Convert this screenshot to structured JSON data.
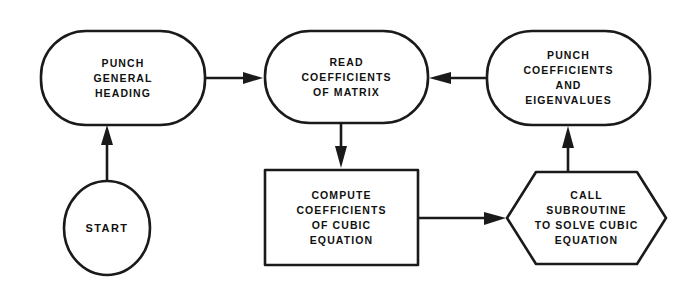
{
  "diagram": {
    "background_color": "#ffffff",
    "ink_color": "#1a1a1a",
    "width": 685,
    "height": 287
  },
  "nodes": {
    "start": {
      "shape": "ellipse",
      "lines": [
        "START"
      ]
    },
    "punch_heading": {
      "shape": "rounded-rectangle",
      "lines": [
        "PUNCH",
        "GENERAL",
        "HEADING"
      ]
    },
    "read_coefficients": {
      "shape": "rounded-rectangle",
      "lines": [
        "READ",
        "COEFFICIENTS",
        "OF MATRIX"
      ]
    },
    "punch_results": {
      "shape": "rounded-rectangle",
      "lines": [
        "PUNCH",
        "COEFFICIENTS",
        "AND",
        "EIGENVALUES"
      ]
    },
    "compute_cubic": {
      "shape": "rectangle",
      "lines": [
        "COMPUTE",
        "COEFFICIENTS",
        "OF CUBIC",
        "EQUATION"
      ]
    },
    "call_subroutine": {
      "shape": "hexagon",
      "lines": [
        "CALL",
        "SUBROUTINE",
        "TO SOLVE CUBIC",
        "EQUATION"
      ]
    }
  },
  "connectors": [
    {
      "id": "start-to-punch-heading",
      "from": "start",
      "to": "punch_heading",
      "direction": "up"
    },
    {
      "id": "punch-heading-to-read",
      "from": "punch_heading",
      "to": "read_coefficients",
      "direction": "right"
    },
    {
      "id": "read-to-compute",
      "from": "read_coefficients",
      "to": "compute_cubic",
      "direction": "down"
    },
    {
      "id": "compute-to-call",
      "from": "compute_cubic",
      "to": "call_subroutine",
      "direction": "right"
    },
    {
      "id": "call-to-punch-results",
      "from": "call_subroutine",
      "to": "punch_results",
      "direction": "up"
    },
    {
      "id": "punch-results-to-read",
      "from": "punch_results",
      "to": "read_coefficients",
      "direction": "left"
    }
  ]
}
